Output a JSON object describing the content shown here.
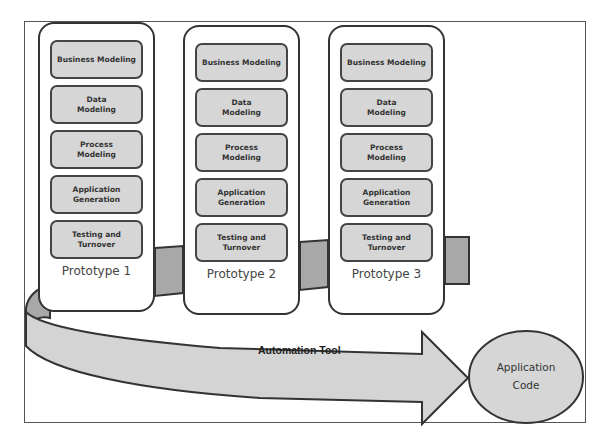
{
  "diagram": {
    "type": "rapid-application-development",
    "prototypes": [
      {
        "label": "Prototype 1",
        "stages": [
          "Business Modeling",
          "Data Modeling",
          "Process Modeling",
          "Application Generation",
          "Testing and Turnover"
        ]
      },
      {
        "label": "Prototype 2",
        "stages": [
          "Business Modeling",
          "Data Modeling",
          "Process Modeling",
          "Application Generation",
          "Testing and Turnover"
        ]
      },
      {
        "label": "Prototype 3",
        "stages": [
          "Business Modeling",
          "Data Modeling",
          "Process Modeling",
          "Application Generation",
          "Testing and Turnover"
        ]
      }
    ],
    "arrow_label": "Automation Tool",
    "output_label": "Application Code",
    "colors": {
      "box_fill": "#d6d6d6",
      "band_back_fill": "#a8a8a8",
      "band_front_fill": "#d4d4d4",
      "stroke": "#333333"
    }
  }
}
